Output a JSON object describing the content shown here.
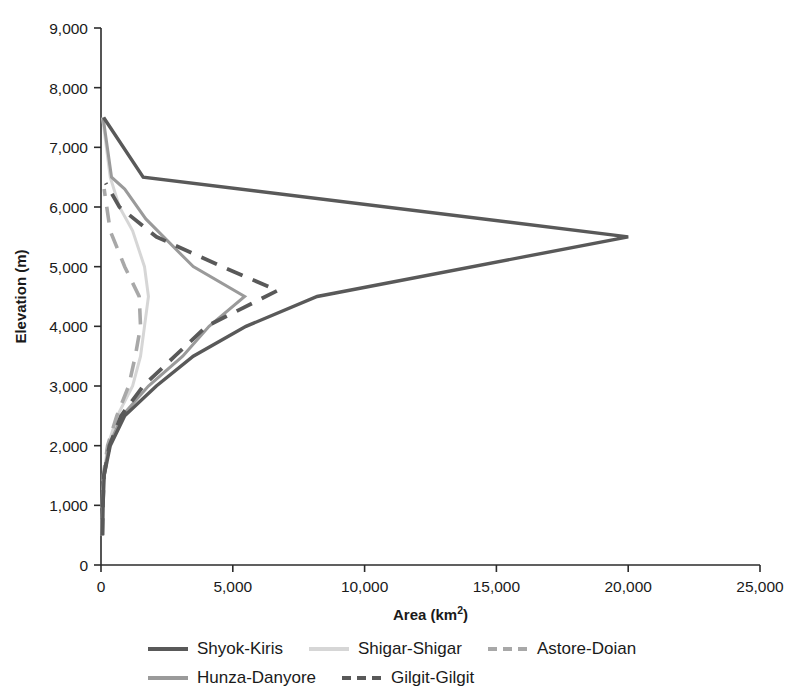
{
  "chart_data": {
    "type": "line",
    "title": "",
    "xlabel": "Area (km2)",
    "xlabel_base": "Area (km",
    "xlabel_sup": "2",
    "xlabel_tail": ")",
    "ylabel": "Elevation (m)",
    "xlim": [
      0,
      25000
    ],
    "ylim": [
      0,
      9000
    ],
    "xticks": [
      0,
      5000,
      10000,
      15000,
      20000,
      25000
    ],
    "yticks": [
      0,
      1000,
      2000,
      3000,
      4000,
      5000,
      6000,
      7000,
      8000,
      9000
    ],
    "xtick_labels": [
      "0",
      "5,000",
      "10,000",
      "15,000",
      "20,000",
      "25,000"
    ],
    "ytick_labels": [
      "0",
      "1,000",
      "2,000",
      "3,000",
      "4,000",
      "5,000",
      "6,000",
      "7,000",
      "8,000",
      "9,000"
    ],
    "grid": false,
    "legend_position": "below",
    "orientation": "area-on-x, elevation-on-y",
    "series": [
      {
        "name": "Shyok-Kiris",
        "color": "#595959",
        "width": 3.4,
        "dash": "none",
        "points": [
          [
            60,
            500
          ],
          [
            80,
            1000
          ],
          [
            120,
            1500
          ],
          [
            350,
            2000
          ],
          [
            900,
            2500
          ],
          [
            2100,
            3000
          ],
          [
            3500,
            3500
          ],
          [
            5500,
            4000
          ],
          [
            8200,
            4500
          ],
          [
            20000,
            5500
          ],
          [
            1600,
            6500
          ],
          [
            100,
            7500
          ]
        ]
      },
      {
        "name": "Hunza-Danyore",
        "color": "#9a9a9a",
        "width": 3.0,
        "dash": "none",
        "points": [
          [
            40,
            500
          ],
          [
            60,
            1000
          ],
          [
            110,
            1500
          ],
          [
            300,
            2000
          ],
          [
            800,
            2500
          ],
          [
            1800,
            3000
          ],
          [
            3100,
            3500
          ],
          [
            4100,
            4000
          ],
          [
            5450,
            4500
          ],
          [
            3500,
            5000
          ],
          [
            1700,
            5800
          ],
          [
            900,
            6300
          ],
          [
            400,
            6500
          ],
          [
            80,
            7500
          ]
        ]
      },
      {
        "name": "Shigar-Shigar",
        "color": "#d6d6d6",
        "width": 3.0,
        "dash": "none",
        "points": [
          [
            30,
            500
          ],
          [
            55,
            1000
          ],
          [
            100,
            1500
          ],
          [
            260,
            2000
          ],
          [
            620,
            2500
          ],
          [
            1200,
            3000
          ],
          [
            1500,
            3500
          ],
          [
            1650,
            4000
          ],
          [
            1800,
            4500
          ],
          [
            1650,
            5000
          ],
          [
            1200,
            5600
          ],
          [
            700,
            6000
          ],
          [
            350,
            6500
          ],
          [
            60,
            7500
          ]
        ]
      },
      {
        "name": "Astore-Doian",
        "color": "#a8a8a8",
        "width": 3.6,
        "dash": "16,11",
        "points": [
          [
            30,
            500
          ],
          [
            50,
            1000
          ],
          [
            90,
            1500
          ],
          [
            250,
            2000
          ],
          [
            600,
            2500
          ],
          [
            1050,
            3000
          ],
          [
            1300,
            3500
          ],
          [
            1500,
            4000
          ],
          [
            1450,
            4500
          ],
          [
            900,
            5000
          ],
          [
            350,
            5600
          ],
          [
            120,
            6300
          ]
        ]
      },
      {
        "name": "Gilgit-Gilgit",
        "color": "#595959",
        "width": 3.8,
        "dash": "17,11",
        "points": [
          [
            50,
            500
          ],
          [
            70,
            1000
          ],
          [
            110,
            1500
          ],
          [
            320,
            2000
          ],
          [
            760,
            2500
          ],
          [
            1600,
            3000
          ],
          [
            2800,
            3500
          ],
          [
            4000,
            4000
          ],
          [
            6700,
            4600
          ],
          [
            4600,
            5000
          ],
          [
            2100,
            5500
          ],
          [
            700,
            6000
          ],
          [
            180,
            6400
          ]
        ]
      }
    ]
  },
  "legend": {
    "rows": [
      [
        {
          "label": "Shyok-Kiris",
          "color": "#595959",
          "dash": "none",
          "width": 4
        },
        {
          "label": "Shigar-Shigar",
          "color": "#d6d6d6",
          "dash": "none",
          "width": 4
        },
        {
          "label": "Astore-Doian",
          "color": "#a8a8a8",
          "dash": "9,6",
          "width": 4
        }
      ],
      [
        {
          "label": "Hunza-Danyore",
          "color": "#9a9a9a",
          "dash": "none",
          "width": 4
        },
        {
          "label": "Gilgit-Gilgit",
          "color": "#595959",
          "dash": "9,6",
          "width": 4
        }
      ]
    ]
  }
}
